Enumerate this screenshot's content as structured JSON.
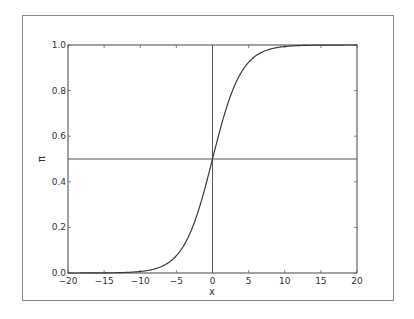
{
  "chart_data": {
    "type": "line",
    "title": "",
    "xlabel": "x",
    "ylabel": "π",
    "xlim": [
      -20,
      20
    ],
    "ylim": [
      0.0,
      1.0
    ],
    "xticks": [
      "−20",
      "−15",
      "−10",
      "−5",
      "0",
      "5",
      "10",
      "15",
      "20"
    ],
    "xtick_values": [
      -20,
      -15,
      -10,
      -5,
      0,
      5,
      10,
      15,
      20
    ],
    "yticks": [
      "0.0",
      "0.2",
      "0.4",
      "0.6",
      "0.8",
      "1.0"
    ],
    "ytick_values": [
      0.0,
      0.2,
      0.4,
      0.6,
      0.8,
      1.0
    ],
    "grid": false,
    "legend": null,
    "series": [
      {
        "name": "logistic",
        "function": "1/(1+exp(-x/2))",
        "x": [
          -20,
          -15,
          -10,
          -8,
          -6,
          -5,
          -4,
          -3,
          -2,
          -1,
          0,
          1,
          2,
          3,
          4,
          5,
          6,
          8,
          10,
          15,
          20
        ],
        "y": [
          0.0,
          0.0006,
          0.0067,
          0.018,
          0.047,
          0.076,
          0.119,
          0.182,
          0.269,
          0.378,
          0.5,
          0.622,
          0.731,
          0.818,
          0.881,
          0.924,
          0.953,
          0.982,
          0.993,
          0.9994,
          1.0
        ]
      }
    ],
    "reference_lines": [
      {
        "orientation": "horizontal",
        "y": 0.5
      },
      {
        "orientation": "vertical",
        "x": 0
      }
    ]
  }
}
